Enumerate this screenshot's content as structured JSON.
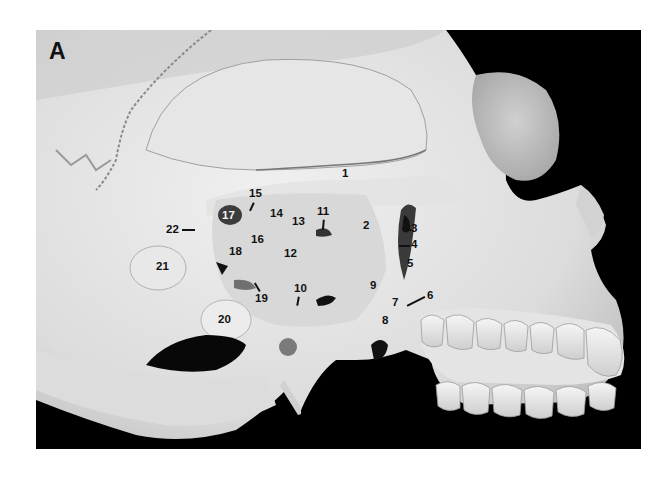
{
  "figure": {
    "panel_letter": "A",
    "colors": {
      "background": "#000000",
      "bone_light": "#e9e9e9",
      "bone_mid": "#cfcfcf",
      "bone_shadow": "#9a9a9a",
      "label_text": "#111111"
    },
    "labels": [
      {
        "id": "1",
        "text": "1",
        "x": 306,
        "y": 138
      },
      {
        "id": "2",
        "text": "2",
        "x": 327,
        "y": 190
      },
      {
        "id": "3",
        "text": "3",
        "x": 374,
        "y": 193
      },
      {
        "id": "4",
        "text": "4",
        "x": 374,
        "y": 210
      },
      {
        "id": "5",
        "text": "5",
        "x": 371,
        "y": 228
      },
      {
        "id": "6",
        "text": "6",
        "x": 391,
        "y": 261
      },
      {
        "id": "7",
        "text": "7",
        "x": 356,
        "y": 267
      },
      {
        "id": "8",
        "text": "8",
        "x": 346,
        "y": 285
      },
      {
        "id": "9",
        "text": "9",
        "x": 334,
        "y": 250
      },
      {
        "id": "10",
        "text": "10",
        "x": 258,
        "y": 253
      },
      {
        "id": "11",
        "text": "11",
        "x": 281,
        "y": 176
      },
      {
        "id": "12",
        "text": "12",
        "x": 248,
        "y": 218
      },
      {
        "id": "13",
        "text": "13",
        "x": 256,
        "y": 186
      },
      {
        "id": "14",
        "text": "14",
        "x": 234,
        "y": 178
      },
      {
        "id": "15",
        "text": "15",
        "x": 213,
        "y": 158
      },
      {
        "id": "16",
        "text": "16",
        "x": 215,
        "y": 204
      },
      {
        "id": "17",
        "text": "17",
        "x": 186,
        "y": 181,
        "light": true
      },
      {
        "id": "18",
        "text": "18",
        "x": 193,
        "y": 216
      },
      {
        "id": "19",
        "text": "19",
        "x": 219,
        "y": 263
      },
      {
        "id": "20",
        "text": "20",
        "x": 182,
        "y": 284
      },
      {
        "id": "21",
        "text": "21",
        "x": 120,
        "y": 231
      },
      {
        "id": "22",
        "text": "22",
        "x": 130,
        "y": 194
      }
    ]
  }
}
